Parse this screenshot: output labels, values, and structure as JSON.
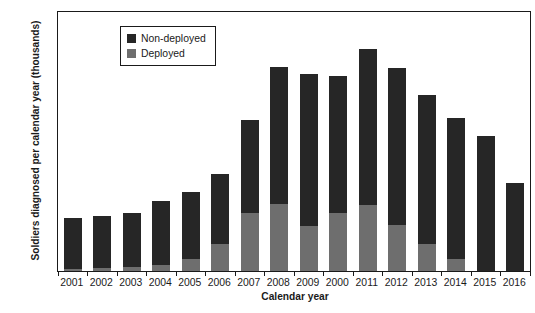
{
  "chart_data": {
    "type": "bar",
    "subtype": "stacked-vertical",
    "title": "",
    "xlabel": "Calendar year",
    "ylabel": "Soldiers diagnosed per calendar year (thousands)",
    "categories": [
      "2001",
      "2002",
      "2003",
      "2004",
      "2005",
      "2006",
      "2007",
      "2008",
      "2009",
      "2000",
      "2011",
      "2012",
      "2013",
      "2014",
      "2015",
      "2016"
    ],
    "series": [
      {
        "name": "Deployed",
        "color": "#6e6e6e",
        "values": [
          0.2,
          0.25,
          0.35,
          0.6,
          1.2,
          2.6,
          5.6,
          6.5,
          4.3,
          5.6,
          6.4,
          4.4,
          2.6,
          1.2,
          0,
          0
        ]
      },
      {
        "name": "Non-deployed",
        "color": "#262626",
        "values": [
          4.9,
          5.1,
          5.25,
          6.2,
          6.4,
          6.8,
          9.0,
          13.2,
          14.7,
          13.2,
          15.0,
          15.2,
          14.4,
          13.6,
          13.0,
          8.5
        ]
      }
    ],
    "totals": [
      5.1,
      5.35,
      5.6,
      6.8,
      7.6,
      9.4,
      14.6,
      19.7,
      19.0,
      18.8,
      21.4,
      19.6,
      17.0,
      14.8,
      13.0,
      8.5
    ],
    "ylim": [
      0,
      25
    ],
    "yticks": [
      0,
      5,
      10,
      15,
      20,
      25
    ],
    "ytick_labels": [
      "0",
      "5",
      "10",
      "15",
      "20",
      "25"
    ],
    "grid": false,
    "legend_position": "top-left",
    "legend_entries": [
      {
        "label": "Non-deployed",
        "color": "#262626"
      },
      {
        "label": "Deployed",
        "color": "#6e6e6e"
      }
    ]
  },
  "colors": {
    "non_deployed": "#262626",
    "deployed": "#6e6e6e",
    "axis": "#1a1a1a",
    "background": "#ffffff"
  }
}
